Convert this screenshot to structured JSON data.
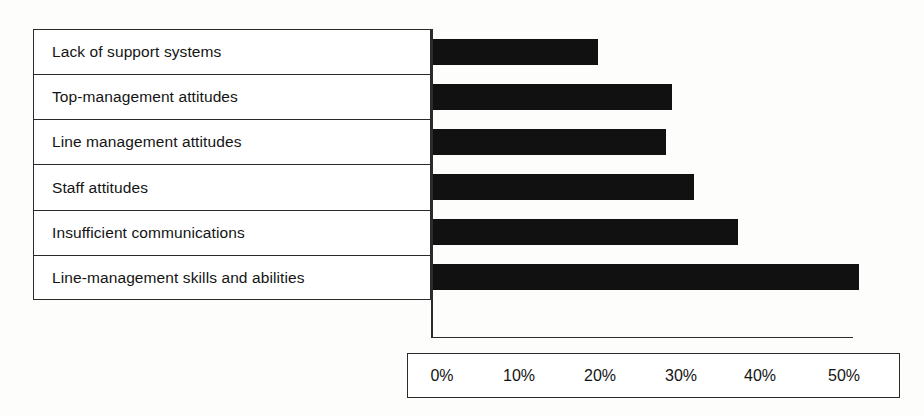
{
  "chart_data": {
    "type": "bar",
    "orientation": "horizontal",
    "title": "",
    "subtitle": "",
    "xlabel": "",
    "ylabel": "",
    "categories": [
      "Lack of support systems",
      "Top-management attitudes",
      "Line management attitudes",
      "Staff attitudes",
      "Insufficient communications",
      "Line-management skills and abilities"
    ],
    "values": [
      20.5,
      29.7,
      29.0,
      32.5,
      38.0,
      53.0
    ],
    "value_suffix": "%",
    "xlim": [
      0,
      55
    ],
    "tick_values": [
      0,
      10,
      20,
      30,
      40,
      50
    ],
    "tick_labels": [
      "0%",
      "10%",
      "20%",
      "30%",
      "40%",
      "50%"
    ],
    "grid": false,
    "legend": false,
    "bar_color": "#111111",
    "axis_color": "#2b2b2b",
    "background_color": "#ffffff"
  },
  "axis": {
    "ticks": [
      {
        "label": "0%",
        "value": 0
      },
      {
        "label": "10%",
        "value": 10
      },
      {
        "label": "20%",
        "value": 20
      },
      {
        "label": "30%",
        "value": 30
      },
      {
        "label": "40%",
        "value": 40
      },
      {
        "label": "50%",
        "value": 50
      }
    ]
  }
}
